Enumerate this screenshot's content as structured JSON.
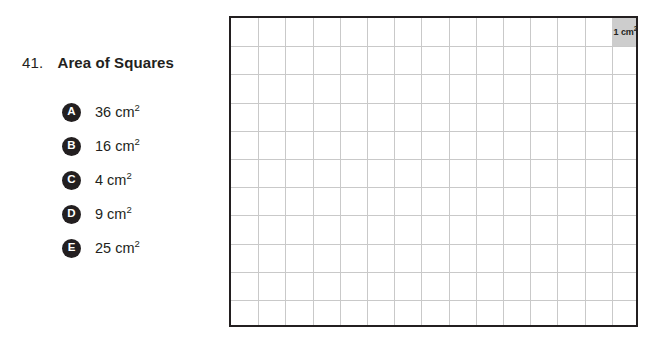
{
  "question": {
    "number": "41.",
    "title": "Area of Squares",
    "options": [
      {
        "letter": "A",
        "value": "36",
        "unit": "cm",
        "exponent": "2"
      },
      {
        "letter": "B",
        "value": "16",
        "unit": "cm",
        "exponent": "2"
      },
      {
        "letter": "C",
        "value": "4",
        "unit": "cm",
        "exponent": "2"
      },
      {
        "letter": "D",
        "value": "9",
        "unit": "cm",
        "exponent": "2"
      },
      {
        "letter": "E",
        "value": "25",
        "unit": "cm",
        "exponent": "2"
      }
    ]
  },
  "grid": {
    "columns": 15,
    "rows": 11,
    "cell_width_px": 27.2,
    "cell_height_px": 28.2,
    "border_color": "#231f20",
    "line_color": "#c9c9c9",
    "unit_cell": {
      "label_value": "1",
      "label_unit": "cm",
      "label_exponent": "2",
      "fill_color": "#cdcdcd",
      "position": "top-right"
    }
  }
}
